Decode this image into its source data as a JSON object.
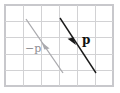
{
  "figure": {
    "background_color": "#ffffff"
  },
  "grid": {
    "name": "square-grid",
    "columns": 6,
    "rows": 5,
    "line_color": "#d2d2d4",
    "border_color": "#c8c8cc",
    "x0": 5,
    "y0": 5,
    "x1": 113,
    "y1": 86
  },
  "vectors": [
    {
      "id": "negative-p",
      "label": "−p",
      "color": "#a9a9ad",
      "label_color": "#8d8d92",
      "label_weight": "normal",
      "label_size": 11,
      "tail_x": 63,
      "tail_y": 73,
      "tip_x": 26,
      "tip_y": 19,
      "head_at_x": 45,
      "head_at_y": 47,
      "head_direction": "up-left",
      "label_x": 25,
      "label_y": 49,
      "components": [
        -37,
        -54
      ]
    },
    {
      "id": "p",
      "label": "p",
      "color": "#1a1a1a",
      "label_color": "#111111",
      "label_weight": "bold",
      "label_size": 12,
      "tail_x": 60,
      "tail_y": 18,
      "tip_x": 96,
      "tip_y": 73,
      "head_at_x": 73,
      "head_at_y": 42,
      "head_direction": "down-right",
      "label_x": 82,
      "label_y": 40,
      "components": [
        36,
        55
      ]
    }
  ]
}
